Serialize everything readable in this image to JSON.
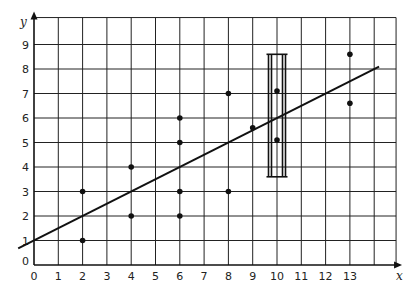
{
  "chart_data": {
    "type": "scatter",
    "title": "",
    "xlabel": "x",
    "ylabel": "y",
    "xlim": [
      0,
      14.9
    ],
    "ylim": [
      0,
      10.1
    ],
    "grid": true,
    "x_ticks": [
      0,
      1,
      2,
      3,
      4,
      5,
      6,
      7,
      8,
      9,
      10,
      11,
      12,
      13
    ],
    "y_ticks": [
      0,
      1,
      2,
      3,
      4,
      5,
      6,
      7,
      8,
      9
    ],
    "x_gridlines": [
      1,
      2,
      3,
      4,
      5,
      6,
      7,
      8,
      9,
      10,
      11,
      12,
      13,
      14
    ],
    "y_gridlines": [
      1,
      2,
      3,
      4,
      5,
      6,
      7,
      8,
      9
    ],
    "series": [
      {
        "name": "data points",
        "points": [
          {
            "x": 2,
            "y": 1
          },
          {
            "x": 2,
            "y": 3
          },
          {
            "x": 4,
            "y": 2
          },
          {
            "x": 4,
            "y": 4
          },
          {
            "x": 6,
            "y": 2
          },
          {
            "x": 6,
            "y": 3
          },
          {
            "x": 6,
            "y": 5
          },
          {
            "x": 6,
            "y": 6
          },
          {
            "x": 8,
            "y": 3
          },
          {
            "x": 8,
            "y": 7
          },
          {
            "x": 9,
            "y": 5.6
          },
          {
            "x": 10,
            "y": 5.1
          },
          {
            "x": 10,
            "y": 7.1
          },
          {
            "x": 13,
            "y": 6.6
          },
          {
            "x": 13,
            "y": 8.6
          }
        ]
      }
    ],
    "fit_line": {
      "slope": 0.5,
      "intercept": 1,
      "x_start": -0.65,
      "x_end": 14.2
    },
    "annotations": [
      {
        "type": "interval-box",
        "x_center": 10,
        "x_halfwidth": 0.35,
        "y_min": 3.6,
        "y_max": 8.6
      }
    ]
  }
}
